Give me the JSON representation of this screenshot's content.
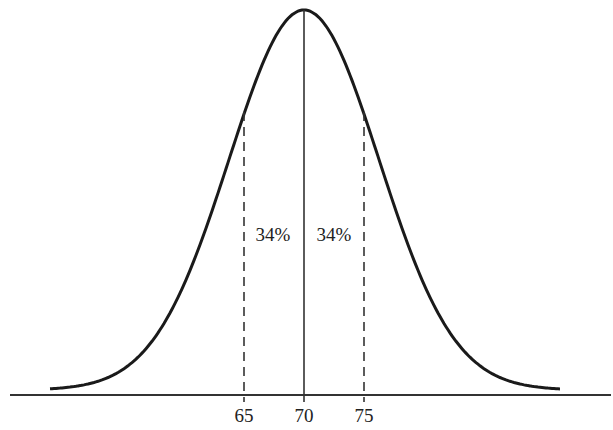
{
  "chart_data": {
    "type": "line",
    "title": "",
    "mean": 70,
    "sd": 5,
    "xlabel": "",
    "ylabel": "",
    "x_ticks": [
      "65",
      "70",
      "75"
    ],
    "annotations": [
      {
        "text": "34%",
        "region": "65-70"
      },
      {
        "text": "34%",
        "region": "70-75"
      }
    ],
    "grid": false,
    "legend": null
  },
  "labels": {
    "tick_65": "65",
    "tick_70": "70",
    "tick_75": "75",
    "left_pct": "34%",
    "right_pct": "34%"
  },
  "colors": {
    "stroke": "#1a1a1a",
    "background": "#ffffff"
  }
}
